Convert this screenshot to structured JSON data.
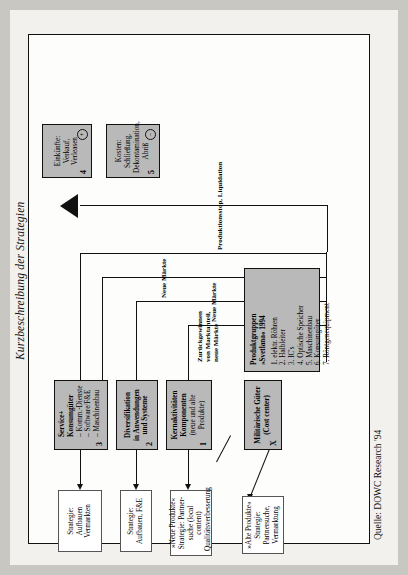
{
  "figure": {
    "caption": "Kurzbeschreibung der Strategien",
    "source": "Quelle: DOWC Research '94"
  },
  "boxes": {
    "military": {
      "marker": "X",
      "title": "Militärische Güter",
      "subtitle": "(Cost center)"
    },
    "core": {
      "marker": "1",
      "title_line1": "Kernaktivitäten",
      "title_line2": "Komponenten",
      "subtitle_line1": "(neue und alte",
      "subtitle_line2": "Produkte)"
    },
    "diversification": {
      "marker": "2",
      "title_line1": "Diversifikation",
      "title_line2": "in Anwendungen",
      "title_line3": "und Systeme"
    },
    "service": {
      "marker": "3",
      "title_line1": "Service+",
      "title_line2": "Konsumgüter",
      "items": [
        "– Komm.-Dienste",
        "– Software/F&E",
        "– Maschinenbau"
      ]
    },
    "strategy_old": {
      "line1": "»Alte Produkte«",
      "line2": "Strategie:",
      "line3": "Partnersuche,",
      "line4": "Vermarktung"
    },
    "strategy_new": {
      "line1": "»Neue Produkte«",
      "line2": "Strategie: Partner-",
      "line3": "suche (local content)",
      "line4": "Qualitätsverbesserung"
    },
    "strategy_build_rd": {
      "line1": "Strategie:",
      "line2": "Aufbauen, F&E"
    },
    "strategy_build_market": {
      "line1": "Strategie:",
      "line2": "Aufbauen",
      "line3": "Vermarkten"
    },
    "income": {
      "marker": "4",
      "sign": "+",
      "line1": "Einkünfte:",
      "line2": "Verkauf,",
      "line3": "Verleasen"
    },
    "cost": {
      "marker": "5",
      "sign": "–",
      "line1": "Kosten:",
      "line2": "Schließung,",
      "line3": "Dekontamination,",
      "line4": "Abriß"
    },
    "product_groups": {
      "title_line1": "Produktgruppen",
      "title_line2": "»Svetlana« 1994",
      "items": [
        "1. elektr. Röhren",
        "2. Halbleiter",
        "3. IC's",
        "4. Optische Speicher",
        "5. Maschinenbau",
        "6. Konsumgüter",
        "7. Röntgenequipment"
      ]
    }
  },
  "labels": {
    "regain": "Zurückgewinnen\nvon Marktanteil,\nneue Märkte",
    "regain_l1": "Zurückgewinnen",
    "regain_l2": "von Marktanteil,",
    "regain_l3": "neue Märkte",
    "new_markets_1": "Neue Märkte",
    "new_markets_2": "Neue Märkte",
    "shutdown": "Produktionsstop, Liquidation"
  },
  "colors": {
    "gray_fill": "#b9b9b9",
    "white_fill": "#ffffff",
    "line": "#111111",
    "page_bg": "#c9c7c1",
    "sheet_bg": "#f2f1ee"
  }
}
